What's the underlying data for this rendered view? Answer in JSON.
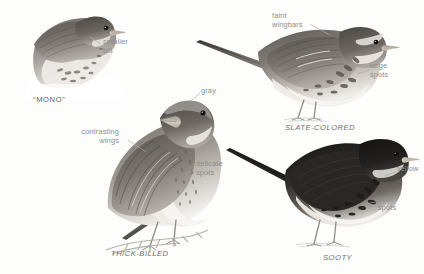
{
  "plate": {
    "title": "Fox Sparrow subspecies plate",
    "style": "grayscale graphite field-guide illustration",
    "background_color": "#fdfdfc",
    "label_color": "#8d8d8d",
    "caption_color": "#6f6f6f"
  },
  "birds": [
    {
      "id": "mono",
      "caption": "“MONO”",
      "pose": "head-and-breast study, facing right",
      "callouts": [
        "smaller\nbill"
      ]
    },
    {
      "id": "slate-colored",
      "caption": "SLATE-COLORED",
      "pose": "full body, standing, facing right",
      "callouts": [
        "faint\nwingbars",
        "large\nspots"
      ]
    },
    {
      "id": "thick-billed",
      "caption": "THICK-BILLED",
      "pose": "full body perched on twig, facing right",
      "callouts": [
        "gray",
        "contrasting\nwings",
        "delicate\nspots"
      ]
    },
    {
      "id": "sooty",
      "caption": "SOOTY",
      "pose": "full body, standing, facing right",
      "callouts": [
        "yellow",
        "dark\nspots"
      ]
    }
  ],
  "callouts": {
    "smaller_bill": "smaller\nbill",
    "faint_wingbars": "faint\nwingbars",
    "large_spots": "large\nspots",
    "gray": "gray",
    "contrasting_wings": "contrasting\nwings",
    "delicate_spots": "delicate\nspots",
    "yellow": "yellow",
    "dark_spots": "dark\nspots"
  },
  "captions": {
    "mono": "“MONO”",
    "slate_colored": "SLATE-COLORED",
    "thick_billed": "THICK-BILLED",
    "sooty": "SOOTY"
  }
}
